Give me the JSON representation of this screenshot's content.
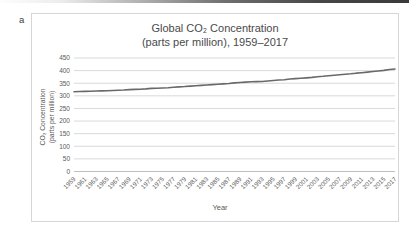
{
  "page": {
    "panel_label": "a"
  },
  "chart_data": {
    "type": "line",
    "title": "Global CO₂ Concentration",
    "subtitle": "(parts per million), 1959–2017",
    "xlabel": "Year",
    "ylabel_line1": "CO₂ Concentration",
    "ylabel_line2": "(parts per million)",
    "ylim": [
      0,
      450
    ],
    "yticks": [
      0,
      50,
      100,
      150,
      200,
      250,
      300,
      350,
      400,
      450
    ],
    "xtick_labels": [
      "1959",
      "1961",
      "1963",
      "1965",
      "1967",
      "1969",
      "1971",
      "1973",
      "1975",
      "1977",
      "1979",
      "1981",
      "1983",
      "1985",
      "1987",
      "1989",
      "1991",
      "1993",
      "1995",
      "1997",
      "1999",
      "2001",
      "2003",
      "2005",
      "2007",
      "2009",
      "2011",
      "2013",
      "2015",
      "2017"
    ],
    "grid": "horizontal",
    "legend": "none",
    "series": [
      {
        "name": "CO₂ concentration (ppm)",
        "x_start": 1959,
        "x_end": 2017,
        "values": [
          315.97,
          316.91,
          317.64,
          318.45,
          318.99,
          319.62,
          320.04,
          321.38,
          322.18,
          323.04,
          324.62,
          325.68,
          326.32,
          327.45,
          329.68,
          330.18,
          331.08,
          332.05,
          333.78,
          335.41,
          336.78,
          338.68,
          340.1,
          341.44,
          343.03,
          344.58,
          346.04,
          347.39,
          349.16,
          351.56,
          353.07,
          354.35,
          355.57,
          356.38,
          357.07,
          358.82,
          360.8,
          362.59,
          363.71,
          366.65,
          368.33,
          369.52,
          371.13,
          373.22,
          375.77,
          377.49,
          379.8,
          381.9,
          383.76,
          385.59,
          387.37,
          389.85,
          391.63,
          393.82,
          396.48,
          398.61,
          400.83,
          404.24,
          406.55
        ]
      }
    ],
    "colors": {
      "line": "#696969",
      "gridline": "#d9d9d9",
      "axis_line": "#bfbfbf",
      "axis_text": "#595959",
      "title_text": "#4a4a4a"
    }
  }
}
